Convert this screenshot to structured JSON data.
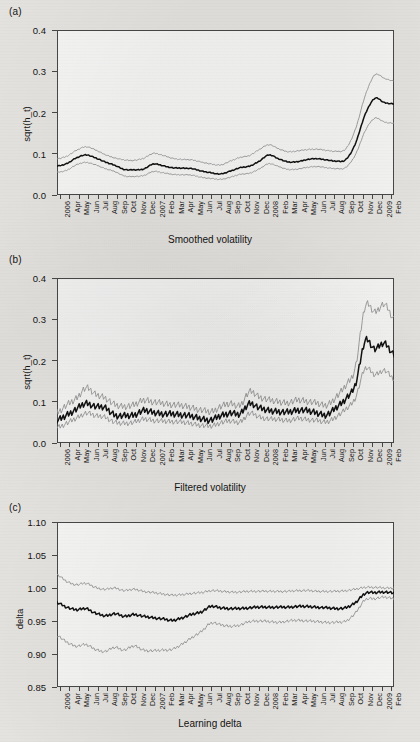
{
  "figure": {
    "panels": [
      {
        "tag": "(a)",
        "caption": "Smoothed volatility",
        "ylabel": "sqrt(h_t)"
      },
      {
        "tag": "(b)",
        "caption": "Filtered volatility",
        "ylabel": "sqrt(h_t)"
      },
      {
        "tag": "(c)",
        "caption": "Learning delta",
        "ylabel": "delta"
      }
    ]
  },
  "colors": {
    "median_line": "#111111",
    "band_line": "#9a9a9a",
    "frame": "#4a4a4a",
    "plot_background": "#fdfdfc",
    "page_background": "#eceae6"
  },
  "x_tick_labels": [
    "2006",
    "Apr",
    "May",
    "Jun",
    "Jul",
    "Aug",
    "Sep",
    "Oct",
    "Nov",
    "Dec",
    "2007",
    "Feb",
    "Mar",
    "Apr",
    "May",
    "Jun",
    "Jul",
    "Aug",
    "Sep",
    "Oct",
    "Nov",
    "Dec",
    "2008",
    "Feb",
    "Mar",
    "Apr",
    "May",
    "Jun",
    "Jul",
    "Aug",
    "Sep",
    "Oct",
    "Nov",
    "Dec",
    "2009",
    "Feb"
  ],
  "chart_data": [
    {
      "type": "line",
      "panel": "(a)",
      "title": "Smoothed volatility",
      "xlabel": "",
      "ylabel": "sqrt(h_t)",
      "ylim": [
        0.0,
        0.4
      ],
      "ytick_labels": [
        "0.0",
        "0.1",
        "0.2",
        "0.3",
        "0.4"
      ],
      "ytick_values": [
        0.0,
        0.1,
        0.2,
        0.3,
        0.4
      ],
      "grid": false,
      "legend_position": "none",
      "x": [
        "2006",
        "Apr",
        "May",
        "Jun",
        "Jul",
        "Aug",
        "Sep",
        "Oct",
        "Nov",
        "Dec",
        "2007",
        "Feb",
        "Mar",
        "Apr",
        "May",
        "Jun",
        "Jul",
        "Aug",
        "Sep",
        "Oct",
        "Nov",
        "Dec",
        "2008",
        "Feb",
        "Mar",
        "Apr",
        "May",
        "Jun",
        "Jul",
        "Aug",
        "Sep",
        "Oct",
        "Nov",
        "Dec",
        "2009",
        "Feb"
      ],
      "series": [
        {
          "name": "upper credible bound",
          "values": [
            0.088,
            0.094,
            0.108,
            0.117,
            0.109,
            0.098,
            0.09,
            0.085,
            0.084,
            0.089,
            0.101,
            0.096,
            0.089,
            0.086,
            0.085,
            0.08,
            0.075,
            0.073,
            0.082,
            0.091,
            0.096,
            0.11,
            0.122,
            0.112,
            0.105,
            0.107,
            0.11,
            0.111,
            0.108,
            0.106,
            0.112,
            0.16,
            0.24,
            0.291,
            0.283,
            0.276
          ]
        },
        {
          "name": "posterior median",
          "values": [
            0.07,
            0.076,
            0.09,
            0.097,
            0.09,
            0.08,
            0.072,
            0.062,
            0.061,
            0.063,
            0.075,
            0.071,
            0.066,
            0.065,
            0.064,
            0.058,
            0.054,
            0.051,
            0.058,
            0.066,
            0.07,
            0.082,
            0.097,
            0.088,
            0.08,
            0.081,
            0.086,
            0.088,
            0.085,
            0.082,
            0.086,
            0.125,
            0.195,
            0.234,
            0.224,
            0.221
          ]
        },
        {
          "name": "lower credible bound",
          "values": [
            0.055,
            0.06,
            0.073,
            0.079,
            0.073,
            0.064,
            0.057,
            0.046,
            0.045,
            0.047,
            0.057,
            0.054,
            0.05,
            0.049,
            0.048,
            0.043,
            0.04,
            0.038,
            0.043,
            0.05,
            0.053,
            0.063,
            0.076,
            0.069,
            0.062,
            0.063,
            0.067,
            0.069,
            0.066,
            0.064,
            0.067,
            0.098,
            0.155,
            0.186,
            0.177,
            0.174
          ]
        }
      ],
      "annotations": {
        "peak_month": "Nov 2008",
        "peak_median": 0.235,
        "final_median": 0.162
      }
    },
    {
      "type": "line",
      "panel": "(b)",
      "title": "Filtered volatility",
      "xlabel": "",
      "ylabel": "sqrt(h_t)",
      "ylim": [
        0.0,
        0.4
      ],
      "ytick_labels": [
        "0.0",
        "0.1",
        "0.2",
        "0.3",
        "0.4"
      ],
      "ytick_values": [
        0.0,
        0.1,
        0.2,
        0.3,
        0.4
      ],
      "grid": false,
      "legend_position": "none",
      "x": [
        "2006",
        "Apr",
        "May",
        "Jun",
        "Jul",
        "Aug",
        "Sep",
        "Oct",
        "Nov",
        "Dec",
        "2007",
        "Feb",
        "Mar",
        "Apr",
        "May",
        "Jun",
        "Jul",
        "Aug",
        "Sep",
        "Oct",
        "Nov",
        "Dec",
        "2008",
        "Feb",
        "Mar",
        "Apr",
        "May",
        "Jun",
        "Jul",
        "Aug",
        "Sep",
        "Oct",
        "Nov",
        "Dec",
        "2009",
        "Feb"
      ],
      "series": [
        {
          "name": "upper credible bound",
          "values": [
            0.075,
            0.092,
            0.108,
            0.133,
            0.118,
            0.11,
            0.093,
            0.089,
            0.092,
            0.104,
            0.1,
            0.096,
            0.093,
            0.09,
            0.086,
            0.08,
            0.076,
            0.088,
            0.095,
            0.092,
            0.124,
            0.112,
            0.104,
            0.1,
            0.098,
            0.104,
            0.101,
            0.096,
            0.092,
            0.112,
            0.14,
            0.185,
            0.33,
            0.318,
            0.336,
            0.3
          ]
        },
        {
          "name": "filtered median",
          "values": [
            0.055,
            0.068,
            0.082,
            0.096,
            0.088,
            0.085,
            0.068,
            0.066,
            0.068,
            0.078,
            0.074,
            0.071,
            0.07,
            0.068,
            0.064,
            0.059,
            0.056,
            0.066,
            0.072,
            0.07,
            0.096,
            0.085,
            0.079,
            0.077,
            0.075,
            0.08,
            0.078,
            0.073,
            0.069,
            0.086,
            0.108,
            0.142,
            0.248,
            0.228,
            0.242,
            0.215
          ]
        },
        {
          "name": "lower credible bound",
          "values": [
            0.038,
            0.048,
            0.06,
            0.072,
            0.066,
            0.063,
            0.05,
            0.048,
            0.05,
            0.058,
            0.055,
            0.053,
            0.052,
            0.05,
            0.047,
            0.043,
            0.041,
            0.049,
            0.053,
            0.051,
            0.072,
            0.063,
            0.058,
            0.057,
            0.055,
            0.059,
            0.057,
            0.054,
            0.051,
            0.064,
            0.082,
            0.11,
            0.18,
            0.166,
            0.176,
            0.155
          ]
        }
      ],
      "annotations": {
        "peak_month": "Nov 2008",
        "peak_median": 0.249,
        "final_median": 0.168
      }
    },
    {
      "type": "line",
      "panel": "(c)",
      "title": "Learning delta",
      "xlabel": "",
      "ylabel": "delta",
      "ylim": [
        0.85,
        1.1
      ],
      "ytick_labels": [
        "0.85",
        "0.90",
        "0.95",
        "1.00",
        "1.05",
        "1.10"
      ],
      "ytick_values": [
        0.85,
        0.9,
        0.95,
        1.0,
        1.05,
        1.1
      ],
      "grid": false,
      "legend_position": "none",
      "x": [
        "2006",
        "Apr",
        "May",
        "Jun",
        "Jul",
        "Aug",
        "Sep",
        "Oct",
        "Nov",
        "Dec",
        "2007",
        "Feb",
        "Mar",
        "Apr",
        "May",
        "Jun",
        "Jul",
        "Aug",
        "Sep",
        "Oct",
        "Nov",
        "Dec",
        "2008",
        "Feb",
        "Mar",
        "Apr",
        "May",
        "Jun",
        "Jul",
        "Aug",
        "Sep",
        "Oct",
        "Nov",
        "Dec",
        "2009",
        "Feb"
      ],
      "series": [
        {
          "name": "upper credible bound",
          "values": [
            1.02,
            1.01,
            1.005,
            1.007,
            1.001,
            0.998,
            1.0,
            0.996,
            0.998,
            0.995,
            0.993,
            0.991,
            0.989,
            0.99,
            0.992,
            0.993,
            0.996,
            0.995,
            0.994,
            0.994,
            0.995,
            0.995,
            0.995,
            0.995,
            0.995,
            0.996,
            0.996,
            0.995,
            0.995,
            0.995,
            0.996,
            0.998,
            1.001,
            1.001,
            1.0,
            1.0
          ]
        },
        {
          "name": "posterior median",
          "values": [
            0.978,
            0.971,
            0.967,
            0.969,
            0.962,
            0.958,
            0.961,
            0.957,
            0.96,
            0.957,
            0.955,
            0.953,
            0.951,
            0.955,
            0.96,
            0.964,
            0.972,
            0.97,
            0.969,
            0.969,
            0.97,
            0.971,
            0.971,
            0.971,
            0.971,
            0.972,
            0.972,
            0.971,
            0.97,
            0.969,
            0.97,
            0.978,
            0.992,
            0.993,
            0.994,
            0.992
          ]
        },
        {
          "name": "lower credible bound",
          "values": [
            0.928,
            0.918,
            0.912,
            0.914,
            0.907,
            0.904,
            0.91,
            0.906,
            0.912,
            0.906,
            0.905,
            0.906,
            0.907,
            0.915,
            0.925,
            0.934,
            0.947,
            0.944,
            0.942,
            0.944,
            0.949,
            0.95,
            0.949,
            0.948,
            0.95,
            0.951,
            0.95,
            0.949,
            0.948,
            0.948,
            0.95,
            0.962,
            0.982,
            0.984,
            0.986,
            0.984
          ]
        }
      ],
      "annotations": {
        "final_median": 0.992,
        "minimum_median": 0.951
      }
    }
  ]
}
